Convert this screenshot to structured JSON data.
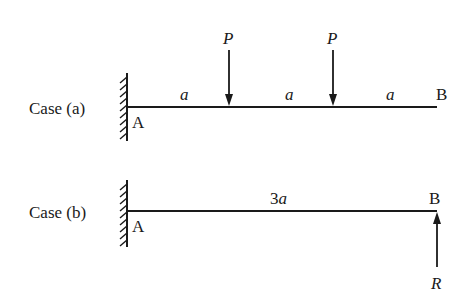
{
  "case_a": {
    "label": "Case (a)",
    "support_label": "A",
    "end_label": "B",
    "loads": [
      {
        "label": "P",
        "direction": "down"
      },
      {
        "label": "P",
        "direction": "down"
      }
    ],
    "segments": [
      "a",
      "a",
      "a"
    ]
  },
  "case_b": {
    "label": "Case (b)",
    "support_label": "A",
    "end_label": "B",
    "span_label": "3a",
    "span_coef": "3",
    "span_var": "a",
    "reaction": {
      "label": "R",
      "direction": "up"
    }
  },
  "colors": {
    "ink": "#1a1a1a",
    "background": "#ffffff"
  }
}
